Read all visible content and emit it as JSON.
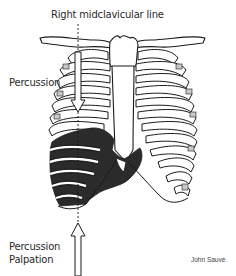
{
  "diagram": {
    "title_label": "Right midclavicular line",
    "upper_label": "Percussion",
    "lower_labels": [
      "Percussion",
      "Palpation"
    ],
    "credit": "John Sauvé",
    "colors": {
      "background": "#ffffff",
      "outline": "#1a1a1a",
      "liver_fill": "#2b2b2b",
      "cartilage_shade": "#c8c8c8",
      "text": "#2a2a2a"
    },
    "arrows": [
      {
        "name": "downward-percussion-arrow",
        "direction": "down",
        "label_ref": "upper_label"
      },
      {
        "name": "upward-percussion-palpation-arrow",
        "direction": "up",
        "label_ref": "lower_labels"
      }
    ]
  }
}
